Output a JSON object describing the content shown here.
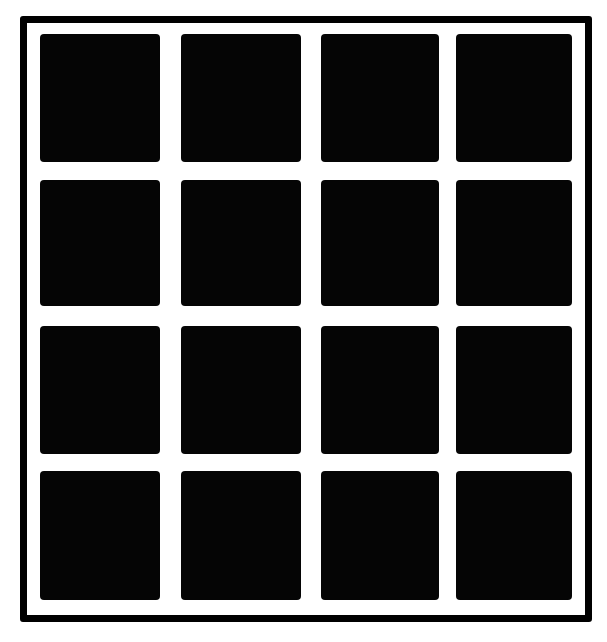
{
  "figure": {
    "rows": 4,
    "cols": 4,
    "colors": {
      "background": "#ffffff",
      "squares": "#050505",
      "frame": "#000000"
    },
    "frame": {
      "left": 20,
      "top": 16,
      "width": 572,
      "height": 606,
      "border": 7
    },
    "col_lefts": [
      40,
      181,
      321,
      456
    ],
    "col_widths": [
      120,
      120,
      118,
      116
    ],
    "row_tops": [
      34,
      180,
      326,
      471
    ],
    "row_heights": [
      128,
      126,
      128,
      129
    ]
  }
}
